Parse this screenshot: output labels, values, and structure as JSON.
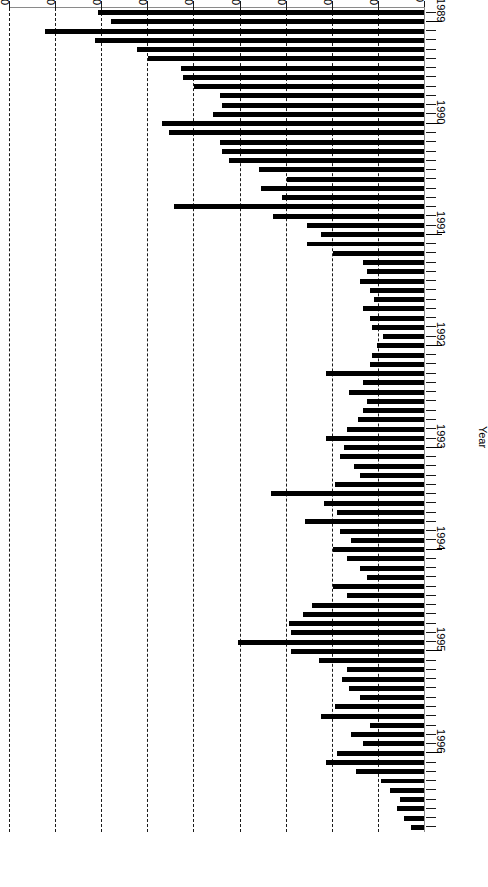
{
  "chart_data": {
    "type": "bar",
    "orientation": "horizontal",
    "title": "",
    "subtitle": "",
    "xlabel": "% Positive flocks",
    "ylabel": "Year",
    "xlim": [
      0,
      90
    ],
    "ylim_categories": [
      "1989",
      "1990",
      "1991",
      "1992",
      "1993",
      "1994",
      "1995",
      "1996"
    ],
    "xticks": [
      0,
      10,
      20,
      30,
      40,
      50,
      60,
      70,
      80,
      90
    ],
    "xtick_labels": [
      "0",
      "10",
      "20",
      "30",
      "40",
      "50",
      "60",
      "70",
      "80",
      "90"
    ],
    "ytick_labels": [
      "1989",
      "1990",
      "1991",
      "1992",
      "1993",
      "1994",
      "1995",
      "1996"
    ],
    "grid": "vertical-dashed",
    "legend": "none",
    "bar_color": "#000000",
    "axis_color": "#8a8a8a",
    "grid_color": "#1a1a1a",
    "n_bars": 89,
    "note_rotated_180": "true",
    "year_tick_indices": [
      1,
      12,
      24,
      36,
      47,
      58,
      69,
      80
    ],
    "values": [
      71.0,
      68.0,
      82.5,
      71.5,
      62.5,
      60.0,
      53.0,
      52.5,
      50.0,
      44.5,
      44.0,
      46.0,
      57.0,
      55.5,
      44.5,
      44.0,
      42.5,
      36.0,
      30.0,
      35.5,
      31.0,
      54.5,
      33.0,
      25.5,
      22.5,
      25.5,
      20.0,
      13.5,
      12.5,
      14.0,
      12.0,
      11.0,
      13.5,
      12.0,
      11.5,
      9.0,
      10.5,
      11.5,
      12.0,
      21.5,
      13.5,
      16.5,
      12.5,
      13.5,
      14.5,
      17.0,
      21.5,
      17.5,
      18.5,
      15.5,
      14.0,
      19.5,
      33.5,
      22.0,
      19.0,
      26.0,
      18.5,
      16.0,
      20.0,
      17.0,
      14.0,
      12.5,
      20.0,
      17.0,
      24.5,
      26.5,
      29.5,
      29.0,
      40.5,
      29.0,
      23.0,
      17.0,
      18.0,
      16.5,
      14.0,
      19.5,
      22.5,
      12.0,
      16.0,
      13.5,
      19.0,
      21.5,
      15.0,
      9.5,
      7.5,
      5.5,
      6.0,
      4.5,
      3.0
    ]
  }
}
